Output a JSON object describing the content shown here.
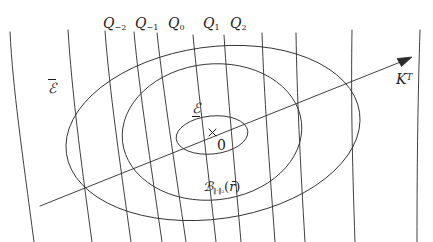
{
  "figure": {
    "width": 433,
    "height": 242,
    "background_color": "#ffffff",
    "stroke_color": "#2a2a2a"
  },
  "labels": {
    "q_curves": [
      {
        "name": "Q_{-2}",
        "base": "Q",
        "subscript": "−2",
        "x": 103,
        "y": 16
      },
      {
        "name": "Q_{-1}",
        "base": "Q",
        "subscript": "−1",
        "x": 135,
        "y": 16
      },
      {
        "name": "Q_0",
        "base": "Q",
        "subscript": "0",
        "x": 168,
        "y": 16
      },
      {
        "name": "Q_1",
        "base": "Q",
        "subscript": "1",
        "x": 203,
        "y": 16
      },
      {
        "name": "Q_2",
        "base": "Q",
        "subscript": "2",
        "x": 230,
        "y": 16
      }
    ],
    "outer_ellipse": {
      "base": "E",
      "decoration": "overline",
      "text": "ℰ"
    },
    "inner_ellipse": {
      "base": "E",
      "decoration": "underline",
      "text": "ℰ"
    },
    "ball": {
      "base": "B",
      "subscript": "‖·‖₂",
      "argument": "r̄",
      "text": "ℬ"
    },
    "axis_arrow": {
      "base": "K",
      "superscript": "T"
    },
    "origin": "0",
    "origin_marker": "×"
  },
  "geometry": {
    "center": {
      "x": 213,
      "y": 133
    },
    "ellipses": [
      {
        "name": "outer-ellipse",
        "rx": 148,
        "ry": 86,
        "rotation": -8
      },
      {
        "name": "middle-ellipse",
        "rx": 90,
        "ry": 68,
        "rotation": -6
      },
      {
        "name": "inner-ellipse",
        "rx": 36,
        "ry": 19,
        "rotation": -6
      }
    ],
    "arrow": {
      "x1": 40,
      "y1": 206,
      "x2": 412,
      "y2": 58
    },
    "curve_count": 11
  }
}
